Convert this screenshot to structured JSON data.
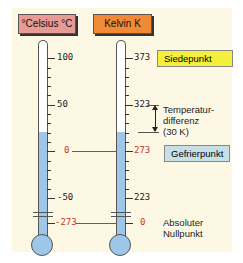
{
  "headers": {
    "celsius": "°Celsius °C",
    "kelvin": "Kelvin K",
    "celsius_color": "#e89a94",
    "kelvin_color": "#f08a36"
  },
  "celsius_labels": {
    "t100": "100",
    "t50": "50",
    "t0": "0",
    "tm50": "-50",
    "tm273": "-273"
  },
  "kelvin_labels": {
    "t373": "373",
    "t323": "323",
    "t273": "273",
    "t223": "223",
    "t0": "0"
  },
  "annotations": {
    "boiling": "Siedepunkt",
    "diff1": "Temperatur-",
    "diff2": "differenz",
    "diff3": "(30 K)",
    "freezing": "Gefrierpunkt",
    "abs1": "Absoluter",
    "abs2": "Nullpunkt"
  },
  "colors": {
    "boiling_box": "#f5ee3a",
    "freezing_box": "#c7e0e8",
    "fill": "#9ec6e8"
  }
}
